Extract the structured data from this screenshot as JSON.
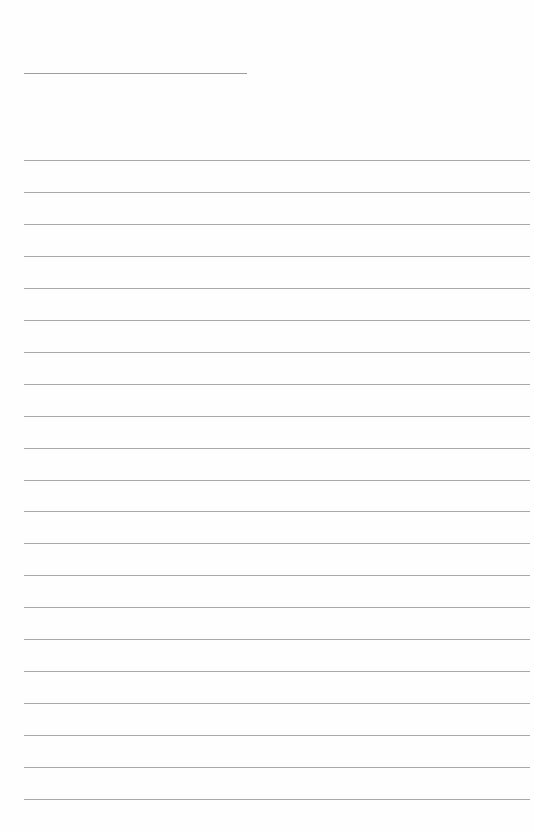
{
  "page": {
    "type": "blank ruled sheet",
    "title_text": "",
    "line_color": "#a8a8a8",
    "background_color": "#fefefe",
    "title_line": {
      "x": 24,
      "y": 73,
      "width": 223
    },
    "ruled_lines": {
      "count": 21,
      "x": 24,
      "width": 506,
      "first_y": 160,
      "spacing": 31.95
    }
  }
}
